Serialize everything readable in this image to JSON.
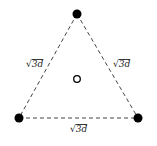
{
  "diagram": {
    "title": "",
    "shape": "equilateral-triangle",
    "colors": {
      "edge": "#444444",
      "vertex_fill": "#000000",
      "center_stroke": "#000000",
      "background": "#ffffff"
    },
    "vertices": [
      {
        "id": "top",
        "x": 77,
        "y": 14,
        "style": "filled"
      },
      {
        "id": "bottom-left",
        "x": 19,
        "y": 118,
        "style": "filled"
      },
      {
        "id": "bottom-right",
        "x": 138,
        "y": 118,
        "style": "filled"
      }
    ],
    "center": {
      "x": 77,
      "y": 79,
      "style": "hollow"
    },
    "edges": [
      {
        "from": "top",
        "to": "bottom-left",
        "style": "dashed",
        "label": "√3d"
      },
      {
        "from": "top",
        "to": "bottom-right",
        "style": "dashed",
        "label": "√3d"
      },
      {
        "from": "bottom-left",
        "to": "bottom-right",
        "style": "dashed",
        "label": "√3d"
      }
    ],
    "labels": {
      "left": {
        "radical": "√",
        "value": "3d"
      },
      "right": {
        "radical": "√",
        "value": "3d"
      },
      "bottom": {
        "radical": "√",
        "value": "3d"
      }
    }
  }
}
